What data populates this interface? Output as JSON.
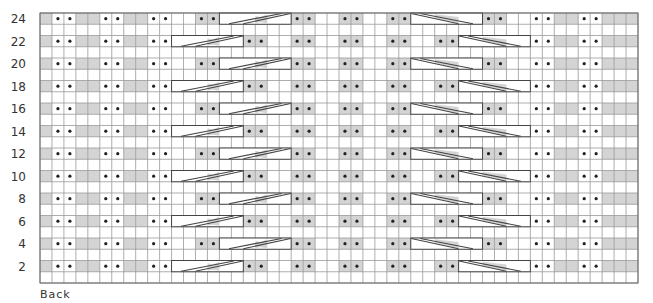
{
  "chart": {
    "footer_label": "Back",
    "colors": {
      "shade": "#d4d4d4",
      "background": "#ffffff",
      "grid_line": "#999999",
      "outline": "#444444",
      "dot": "#222222"
    },
    "grid": {
      "left": 40,
      "top": 13,
      "columns": 50,
      "rows": 24,
      "cell_width": 11.96,
      "row_height": 11.25
    },
    "legend_codes": {
      "g": "shaded cell",
      "w": "blank cell",
      "d": "blank cell with dot (purl)",
      "D": "shaded cell with dot (purl)",
      "L": "6-stitch right-leaning cable",
      "R": "6-stitch left-leaning cable"
    },
    "row_types": {
      "A": {
        "cells": [
          "g",
          "d",
          "d",
          "g",
          "g",
          "d",
          "d",
          "g",
          "g",
          "d",
          "d",
          "w",
          "w",
          "D",
          "D",
          "L",
          "L",
          "L",
          "L",
          "L",
          "L",
          "D",
          "D",
          "w",
          "w",
          "D",
          "D",
          "w",
          "w",
          "D",
          "D",
          "R",
          "R",
          "R",
          "R",
          "R",
          "R",
          "D",
          "D",
          "w",
          "w",
          "d",
          "d",
          "g",
          "g",
          "d",
          "d",
          "g",
          "g",
          "g"
        ],
        "cables": [
          {
            "dir": "L",
            "start": 15,
            "span": 6
          },
          {
            "dir": "R",
            "start": 31,
            "span": 6
          }
        ]
      },
      "B": {
        "cells": [
          "g",
          "d",
          "d",
          "g",
          "g",
          "d",
          "d",
          "g",
          "g",
          "d",
          "d",
          "L",
          "L",
          "L",
          "L",
          "L",
          "L",
          "D",
          "D",
          "w",
          "w",
          "D",
          "D",
          "w",
          "w",
          "D",
          "D",
          "w",
          "w",
          "D",
          "D",
          "w",
          "w",
          "D",
          "D",
          "R",
          "R",
          "R",
          "R",
          "R",
          "R",
          "d",
          "d",
          "g",
          "g",
          "d",
          "d",
          "g",
          "g",
          "g"
        ],
        "cables": [
          {
            "dir": "L",
            "start": 11,
            "span": 6
          },
          {
            "dir": "R",
            "start": 35,
            "span": 6
          }
        ]
      },
      "plain": {
        "cells": [],
        "cables": []
      }
    },
    "rows": [
      {
        "number": 24,
        "label": "24",
        "type": "A"
      },
      {
        "number": 23,
        "label": "",
        "type": "plain"
      },
      {
        "number": 22,
        "label": "22",
        "type": "B"
      },
      {
        "number": 21,
        "label": "",
        "type": "plain"
      },
      {
        "number": 20,
        "label": "20",
        "type": "A"
      },
      {
        "number": 19,
        "label": "",
        "type": "plain"
      },
      {
        "number": 18,
        "label": "18",
        "type": "B"
      },
      {
        "number": 17,
        "label": "",
        "type": "plain"
      },
      {
        "number": 16,
        "label": "16",
        "type": "A"
      },
      {
        "number": 15,
        "label": "",
        "type": "plain"
      },
      {
        "number": 14,
        "label": "14",
        "type": "B"
      },
      {
        "number": 13,
        "label": "",
        "type": "plain"
      },
      {
        "number": 12,
        "label": "12",
        "type": "A"
      },
      {
        "number": 11,
        "label": "",
        "type": "plain"
      },
      {
        "number": 10,
        "label": "10",
        "type": "B"
      },
      {
        "number": 9,
        "label": "",
        "type": "plain"
      },
      {
        "number": 8,
        "label": "8",
        "type": "A"
      },
      {
        "number": 7,
        "label": "",
        "type": "plain"
      },
      {
        "number": 6,
        "label": "6",
        "type": "B"
      },
      {
        "number": 5,
        "label": "",
        "type": "plain"
      },
      {
        "number": 4,
        "label": "4",
        "type": "A"
      },
      {
        "number": 3,
        "label": "",
        "type": "plain"
      },
      {
        "number": 2,
        "label": "2",
        "type": "B"
      },
      {
        "number": 1,
        "label": "",
        "type": "plain"
      }
    ]
  }
}
